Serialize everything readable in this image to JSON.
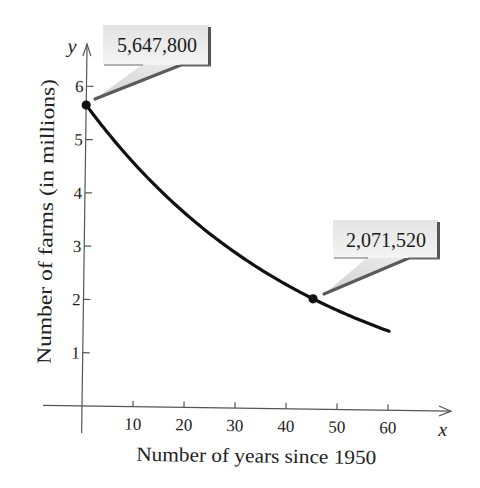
{
  "chart_data": {
    "type": "line",
    "title": "",
    "xlabel": "Number of years since 1950",
    "ylabel": "Number of farms (in millions)",
    "x_axis_symbol": "x",
    "y_axis_symbol": "y",
    "xlim": [
      0,
      60
    ],
    "ylim": [
      0,
      6
    ],
    "x_ticks": [
      10,
      20,
      30,
      40,
      50,
      60
    ],
    "y_ticks": [
      1,
      2,
      3,
      4,
      5,
      6
    ],
    "grid": false,
    "legend": null,
    "model": {
      "form": "exponential decay",
      "a": 5.6478,
      "k": -0.022288
    },
    "series": [
      {
        "name": "Number of farms (millions)",
        "x": [
          0,
          5,
          10,
          15,
          20,
          25,
          30,
          35,
          40,
          45,
          50,
          55,
          60
        ],
        "y": [
          5.648,
          5.052,
          4.519,
          4.043,
          3.617,
          3.235,
          2.894,
          2.589,
          2.316,
          2.072,
          1.853,
          1.658,
          1.483
        ]
      }
    ],
    "points": [
      {
        "x": 0,
        "y": 5.6478,
        "label": "5,647,800"
      },
      {
        "x": 45,
        "y": 2.07152,
        "label": "2,071,520"
      }
    ]
  },
  "callouts": {
    "first": "5,647,800",
    "second": "2,071,520"
  },
  "colors": {
    "curve": "#111111",
    "axis": "#555555",
    "callout_fill_top": "#e4e4e4",
    "callout_fill_bottom": "#f3f3f3",
    "callout_shadow": "#555555"
  }
}
